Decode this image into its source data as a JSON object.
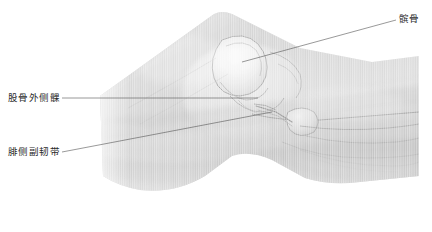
{
  "figure": {
    "kind": "anatomical-illustration",
    "canvas": {
      "width": 432,
      "height": 232
    },
    "background_color": "#ffffff",
    "render_style": "grayscale pencil/wash rendering with vertical scan-line striping",
    "palette": {
      "paper": "#ffffff",
      "tissue_light": "#f0f0f0",
      "tissue_mid": "#d8d8d8",
      "tissue_dark": "#b4b4b4",
      "outline": "#9a9a9a",
      "leader_line": "#5a5a5a",
      "label_text": "#2b2b2b"
    }
  },
  "labels": [
    {
      "id": "patella",
      "text": "髌骨",
      "meaning": "patella",
      "position": "top-right",
      "text_x": 399,
      "text_y": 13,
      "leader": {
        "from_x": 396,
        "from_y": 20,
        "to_x": 242,
        "to_y": 62
      }
    },
    {
      "id": "lateral-femoral-condyle",
      "text": "股骨外侧髁",
      "meaning": "lateral femoral condyle",
      "position": "middle-left",
      "text_x": 8,
      "text_y": 92,
      "leader": {
        "from_x": 62,
        "from_y": 98,
        "to_x": 258,
        "to_y": 98
      }
    },
    {
      "id": "fibular-collateral-ligament",
      "text": "腓侧副韧带",
      "meaning": "fibular collateral ligament",
      "position": "lower-left",
      "text_x": 8,
      "text_y": 146,
      "leader": {
        "from_x": 62,
        "from_y": 152,
        "to_x": 272,
        "to_y": 112
      }
    }
  ],
  "structures": [
    {
      "id": "femur-shaft",
      "name": "股骨干",
      "meaning": "femoral shaft",
      "region": "upper-left wedge"
    },
    {
      "id": "patella-bone",
      "name": "髌骨",
      "meaning": "patella",
      "region": "central-upper rounded outline"
    },
    {
      "id": "femoral-condyle",
      "name": "股骨外侧髁",
      "meaning": "lateral femoral condyle",
      "region": "central"
    },
    {
      "id": "tibia",
      "name": "胫骨",
      "meaning": "tibia",
      "region": "right elongated mass"
    },
    {
      "id": "fibula-head",
      "name": "腓骨头",
      "meaning": "fibular head",
      "region": "right of joint line"
    },
    {
      "id": "collateral-ligament",
      "name": "腓侧副韧带",
      "meaning": "fibular collateral ligament",
      "region": "joint line band"
    }
  ]
}
